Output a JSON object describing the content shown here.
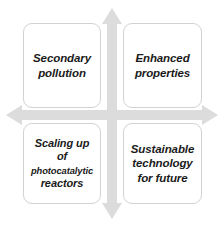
{
  "diagram": {
    "type": "two-by-two-quadrant-matrix",
    "background_color": "#ffffff",
    "arrow_color": "#d9d9d9",
    "box_border_color": "#d2d2d2",
    "text_color": "#1a1a1a",
    "axes": {
      "vertical_arrow": {
        "name": "vertical-double-arrow",
        "direction": "both",
        "label": ""
      },
      "horizontal_arrow": {
        "name": "horizontal-double-arrow",
        "direction": "both",
        "label": ""
      }
    },
    "quadrants": [
      {
        "id": "secondary-pollution",
        "position": "top-left",
        "lines": [
          "Secondary",
          "pollution"
        ]
      },
      {
        "id": "enhanced-properties",
        "position": "top-right",
        "lines": [
          "Enhanced",
          "properties"
        ]
      },
      {
        "id": "scaling-up",
        "position": "bottom-left",
        "lines": [
          "Scaling up",
          "of",
          "photocatalytic",
          "reactors"
        ],
        "emphasis_small_line": "photocatalytic"
      },
      {
        "id": "sustainable-technology",
        "position": "bottom-right",
        "lines": [
          "Sustainable",
          "technology",
          "for future"
        ]
      }
    ]
  }
}
